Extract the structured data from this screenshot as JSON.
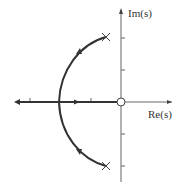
{
  "diagram": {
    "type": "root-locus",
    "axes": {
      "x_label": "Re(s)",
      "y_label": "Im(s)"
    },
    "poles": [
      {
        "re": -0.5,
        "im": 2
      },
      {
        "re": -0.5,
        "im": -2
      }
    ],
    "zeros": [
      {
        "re": 0,
        "im": 0
      }
    ],
    "breakaway_point": {
      "re": -2,
      "im": 0
    },
    "colors": {
      "locus": "#333333",
      "axis": "#555555"
    }
  }
}
